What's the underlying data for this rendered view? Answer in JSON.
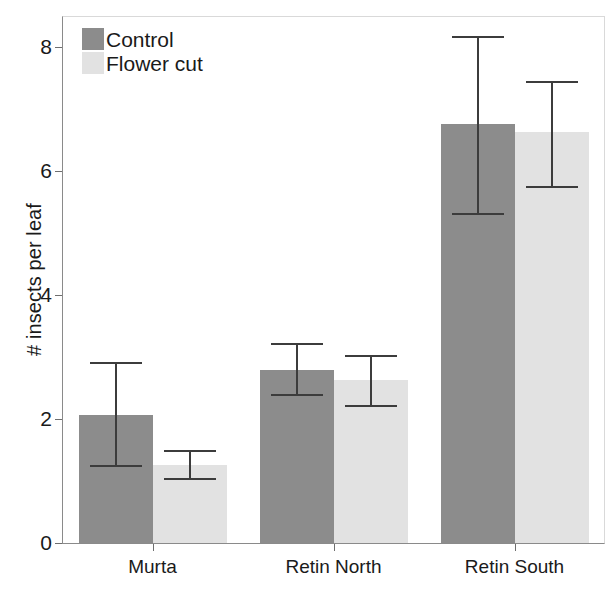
{
  "chart_data": {
    "type": "bar",
    "title": "",
    "subtitle": "",
    "xlabel": "",
    "ylabel": "# insects per leaf",
    "categories": [
      "Murta",
      "Retin North",
      "Retin South"
    ],
    "ylim": [
      0,
      8.6
    ],
    "yticks": [
      0,
      2,
      4,
      6,
      8
    ],
    "ytick_labels": [
      "0",
      "2",
      "4",
      "6",
      "8"
    ],
    "grid": false,
    "legend_position": "top-left",
    "orientation": "vertical",
    "error_bars": "symmetric-caps",
    "series": [
      {
        "name": "Control",
        "color": "#8c8c8c",
        "values": [
          2.06,
          2.79,
          6.76
        ],
        "err_low": [
          1.26,
          2.4,
          5.32
        ],
        "err_high": [
          2.92,
          3.22,
          8.18
        ]
      },
      {
        "name": "Flower cut",
        "color": "#e2e2e2",
        "values": [
          1.26,
          2.63,
          6.63
        ],
        "err_low": [
          1.05,
          2.23,
          5.76
        ],
        "err_high": [
          1.5,
          3.03,
          7.45
        ]
      }
    ]
  },
  "legend": {
    "items": [
      {
        "label": "Control",
        "swatch": "control"
      },
      {
        "label": "Flower cut",
        "swatch": "flower"
      }
    ]
  },
  "axes": {
    "y_title": "# insects per leaf",
    "y_tick_labels": [
      "8",
      "6",
      "4",
      "2",
      "0"
    ],
    "x_tick_labels": [
      "Murta",
      "Retin North",
      "Retin South"
    ]
  },
  "colors": {
    "control": "#8c8c8c",
    "flower_cut": "#e2e2e2",
    "error_bar": "#3c3c3c",
    "axis": "#8a8a8a",
    "text": "#1a1a1a",
    "background": "#ffffff"
  }
}
